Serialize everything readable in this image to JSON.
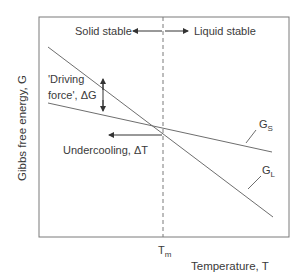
{
  "diagram": {
    "title": "",
    "y_axis_label": "Gibbs free energy, G",
    "x_axis_label": "Temperature, T",
    "melting_point": {
      "symbol": "T",
      "subscript": "m"
    },
    "regions": {
      "left": "Solid stable",
      "right": "Liquid stable"
    },
    "annotations": {
      "driving_force_line1": "'Driving",
      "driving_force_line2": "force', ΔG",
      "undercooling": "Undercooling, ΔT"
    },
    "curves": [
      {
        "name": "G_S",
        "symbol": "G",
        "subscript": "S",
        "description": "Solid free energy, shallower slope"
      },
      {
        "name": "G_L",
        "symbol": "G",
        "subscript": "L",
        "description": "Liquid free energy, steeper slope"
      }
    ],
    "colors": {
      "line": "#6e6e6e",
      "text": "#3a3a3a",
      "frame": "#6e6e6e"
    }
  }
}
